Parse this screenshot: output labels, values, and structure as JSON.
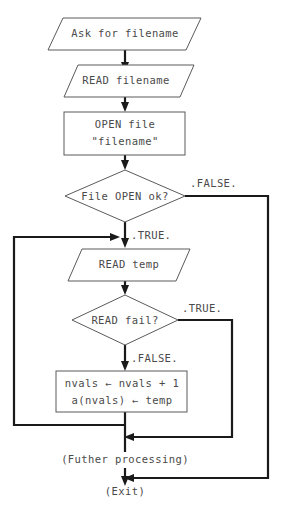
{
  "diagram": {
    "canvas": {
      "width": 283,
      "height": 510,
      "background": "#ffffff"
    },
    "colors": {
      "shape_stroke": "#5a5a5a",
      "connector": "#1a1a1a",
      "text": "#4a4a4a",
      "background": "#ffffff"
    },
    "nodes": [
      {
        "id": "ask",
        "type": "io-parallelogram",
        "label": "Ask for filename"
      },
      {
        "id": "read_filename",
        "type": "io-parallelogram",
        "label": "READ filename"
      },
      {
        "id": "open_file",
        "type": "process-box",
        "line1": "OPEN file",
        "line2": "\"filename\""
      },
      {
        "id": "file_open_ok",
        "type": "decision-diamond",
        "label": "File OPEN ok?"
      },
      {
        "id": "read_temp",
        "type": "io-parallelogram",
        "label": "READ temp"
      },
      {
        "id": "read_fail",
        "type": "decision-diamond",
        "label": "READ fail?"
      },
      {
        "id": "assign",
        "type": "process-box",
        "line1": "nvals ← nvals + 1",
        "line2": "a(nvals) ← temp"
      },
      {
        "id": "further",
        "type": "plain-text",
        "label": "(Futher processing)"
      },
      {
        "id": "exit",
        "type": "plain-text",
        "label": "(Exit)"
      }
    ],
    "branch_labels": {
      "open_false": ".FALSE.",
      "open_true": ".TRUE.",
      "fail_true": ".TRUE.",
      "fail_false": ".FALSE."
    }
  }
}
